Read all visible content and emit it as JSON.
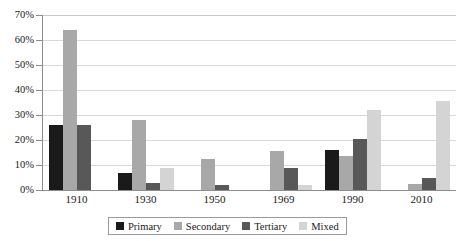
{
  "chart_data": {
    "type": "bar",
    "title": "",
    "subtitle": "",
    "xlabel": "",
    "ylabel": "",
    "categories": [
      "1910",
      "1930",
      "1950",
      "1969",
      "1990",
      "2010"
    ],
    "series": [
      {
        "name": "Primary",
        "color": "#1a1a1a",
        "values": [
          26,
          7,
          0,
          0,
          16,
          0
        ]
      },
      {
        "name": "Secondary",
        "color": "#a8a8a8",
        "values": [
          64,
          28,
          12.5,
          15.5,
          13.5,
          2.5
        ]
      },
      {
        "name": "Tertiary",
        "color": "#585858",
        "values": [
          26,
          3,
          2,
          9,
          20.5,
          5
        ]
      },
      {
        "name": "Mixed",
        "color": "#d4d4d4",
        "values": [
          0,
          9,
          0,
          2,
          32,
          35.5
        ]
      }
    ],
    "ylim": [
      0,
      70
    ],
    "ytick_step": 10,
    "ytick_labels": [
      "0%",
      "10%",
      "20%",
      "30%",
      "40%",
      "50%",
      "60%",
      "70%"
    ],
    "ytick_values": [
      0,
      10,
      20,
      30,
      40,
      50,
      60,
      70
    ],
    "grid": true,
    "grid_axis": "y",
    "legend_position": "bottom-center",
    "legend_entries": [
      "Primary",
      "Secondary",
      "Tertiary",
      "Mixed"
    ],
    "annotations": []
  }
}
